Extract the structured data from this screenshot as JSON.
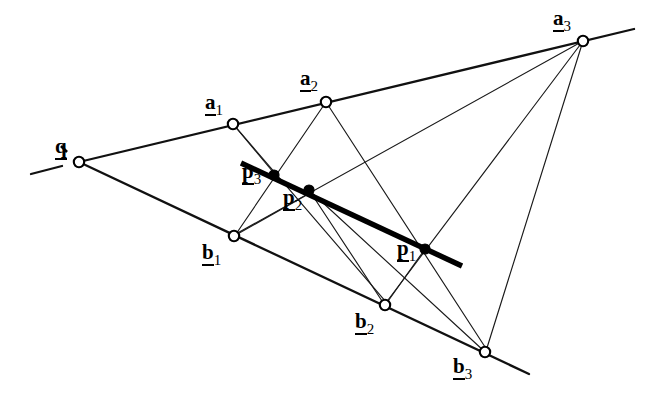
{
  "figure": {
    "width": 666,
    "height": 402,
    "background_color": "#ffffff",
    "ink_color": "#000000"
  },
  "points": [
    {
      "id": "q",
      "base": "q",
      "sub": "",
      "x": 79,
      "y": 162,
      "style": "open",
      "label_dx": -24,
      "label_dy": -26
    },
    {
      "id": "a1",
      "base": "a",
      "sub": "1",
      "x": 233,
      "y": 124,
      "style": "open",
      "label_dx": -28,
      "label_dy": -32
    },
    {
      "id": "a2",
      "base": "a",
      "sub": "2",
      "x": 326,
      "y": 102,
      "style": "open",
      "label_dx": -26,
      "label_dy": -34
    },
    {
      "id": "a3",
      "base": "a",
      "sub": "3",
      "x": 583,
      "y": 41,
      "style": "open",
      "label_dx": -30,
      "label_dy": -33
    },
    {
      "id": "b1",
      "base": "b",
      "sub": "1",
      "x": 234,
      "y": 236,
      "style": "open",
      "label_dx": -32,
      "label_dy": 6
    },
    {
      "id": "b2",
      "base": "b",
      "sub": "2",
      "x": 385,
      "y": 305,
      "style": "open",
      "label_dx": -30,
      "label_dy": 6
    },
    {
      "id": "b3",
      "base": "b",
      "sub": "3",
      "x": 485,
      "y": 352,
      "style": "open",
      "label_dx": -32,
      "label_dy": 4
    },
    {
      "id": "p1",
      "base": "p",
      "sub": "1",
      "x": 425,
      "y": 249,
      "style": "filled",
      "label_dx": -28,
      "label_dy": -11
    },
    {
      "id": "p2",
      "base": "p",
      "sub": "2",
      "x": 309,
      "y": 190,
      "style": "filled",
      "label_dx": -26,
      "label_dy": -3
    },
    {
      "id": "p3",
      "base": "p",
      "sub": "3",
      "x": 274,
      "y": 175,
      "style": "filled",
      "label_dx": -32,
      "label_dy": -14
    }
  ],
  "labels": {
    "q": {
      "base": "q",
      "sub": ""
    },
    "a1": {
      "base": "a",
      "sub": "1"
    },
    "a2": {
      "base": "a",
      "sub": "2"
    },
    "a3": {
      "base": "a",
      "sub": "3"
    },
    "b1": {
      "base": "b",
      "sub": "1"
    },
    "b2": {
      "base": "b",
      "sub": "2"
    },
    "b3": {
      "base": "b",
      "sub": "3"
    },
    "p1": {
      "base": "p",
      "sub": "1"
    },
    "p2": {
      "base": "p",
      "sub": "2"
    },
    "p3": {
      "base": "p",
      "sub": "3"
    }
  },
  "segments": [
    {
      "name": "line-q-a1-a2-a3",
      "weight": "medium",
      "x1": 79,
      "y1": 162,
      "x2": 634,
      "y2": 29
    },
    {
      "name": "line-q-b1-b2-b3",
      "weight": "medium",
      "x1": 79,
      "y1": 162,
      "x2": 529,
      "y2": 374
    },
    {
      "name": "dash-left-of-q",
      "weight": "medium",
      "x1": 31,
      "y1": 174,
      "x2": 62,
      "y2": 166
    },
    {
      "name": "tick-above-q",
      "weight": "tick",
      "x1": 61,
      "y1": 146,
      "x2": 67,
      "y2": 152
    },
    {
      "name": "line-a1-p3",
      "weight": "thin",
      "x1": 233,
      "y1": 124,
      "x2": 278,
      "y2": 178
    },
    {
      "name": "line-a1-p2-b2",
      "weight": "thin",
      "x1": 233,
      "y1": 124,
      "x2": 387,
      "y2": 303
    },
    {
      "name": "line-a2-p3-b1",
      "weight": "thin",
      "x1": 326,
      "y1": 102,
      "x2": 236,
      "y2": 234
    },
    {
      "name": "line-a2-p1-b3",
      "weight": "thin",
      "x1": 326,
      "y1": 102,
      "x2": 487,
      "y2": 350
    },
    {
      "name": "line-a3-p2-b1",
      "weight": "thin",
      "x1": 583,
      "y1": 41,
      "x2": 234,
      "y2": 235
    },
    {
      "name": "line-a3-p1-b2",
      "weight": "thin",
      "x1": 583,
      "y1": 41,
      "x2": 385,
      "y2": 304
    },
    {
      "name": "line-a3-b3",
      "weight": "thin",
      "x1": 583,
      "y1": 41,
      "x2": 486,
      "y2": 351
    },
    {
      "name": "line-b1-p2-a3-short",
      "weight": "thin",
      "x1": 234,
      "y1": 236,
      "x2": 312,
      "y2": 192
    },
    {
      "name": "line-p2-b3",
      "weight": "thin",
      "x1": 309,
      "y1": 190,
      "x2": 484,
      "y2": 351
    },
    {
      "name": "line-p2-b2",
      "weight": "thin",
      "x1": 309,
      "y1": 190,
      "x2": 384,
      "y2": 304
    },
    {
      "name": "line-p1-b2",
      "weight": "thin",
      "x1": 425,
      "y1": 249,
      "x2": 386,
      "y2": 304
    },
    {
      "name": "thick-line-p3-p2-p1",
      "weight": "thick",
      "x1": 241,
      "y1": 163,
      "x2": 462,
      "y2": 266
    }
  ],
  "geometry_notes": {
    "pencil_center": "q",
    "range_a": [
      "a1",
      "a2",
      "a3"
    ],
    "range_b": [
      "b1",
      "b2",
      "b3"
    ],
    "intersection_points": [
      "p1",
      "p2",
      "p3"
    ],
    "collinear_highlight": "thick line through p3, p2, p1"
  }
}
